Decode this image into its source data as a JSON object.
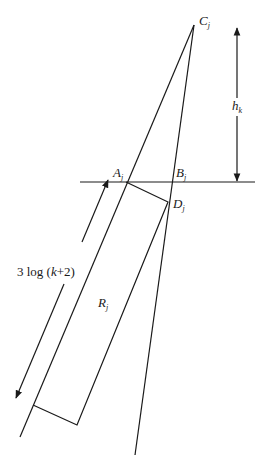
{
  "figure": {
    "colors": {
      "stroke": "#1a1a1a",
      "background": "#ffffff"
    }
  },
  "labels": {
    "C": {
      "main": "C",
      "sub": "j"
    },
    "A": {
      "main": "A",
      "sub": "j"
    },
    "B": {
      "main": "B",
      "sub": "j"
    },
    "D": {
      "main": "D",
      "sub": "j"
    },
    "R": {
      "main": "R",
      "sub": "j"
    },
    "h": {
      "main": "h",
      "sub": "k"
    },
    "length": {
      "prefix": "3 log (",
      "var": "k",
      "suffix": "+2)"
    }
  },
  "points": {
    "C_j": [
      194,
      25
    ],
    "A_j": [
      126,
      182
    ],
    "B_j": [
      173,
      182
    ],
    "D_j": [
      168,
      202
    ],
    "rect_bottom_left": [
      33,
      405
    ],
    "rect_bottom_right": [
      77,
      425
    ]
  },
  "lines": {
    "horizontal": {
      "from": [
        80,
        182
      ],
      "to": [
        255,
        182
      ]
    },
    "ray_left": {
      "from": [
        194,
        25
      ],
      "to": [
        20,
        437
      ]
    },
    "ray_right": {
      "from": [
        194,
        25
      ],
      "to": [
        135,
        455
      ]
    },
    "height_arrow": {
      "from": [
        237,
        27
      ],
      "to": [
        237,
        182
      ]
    },
    "length_arrow": {
      "from": [
        108,
        180
      ],
      "to": [
        16,
        398
      ]
    }
  }
}
